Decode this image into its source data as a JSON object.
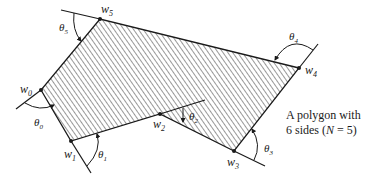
{
  "diagram": {
    "type": "polygon-figure",
    "vertices": [
      {
        "id": "w0",
        "label": "w",
        "sub": "0",
        "x": 41,
        "y": 90
      },
      {
        "id": "w1",
        "label": "w",
        "sub": "1",
        "x": 71,
        "y": 141
      },
      {
        "id": "w2",
        "label": "w",
        "sub": "2",
        "x": 160,
        "y": 114
      },
      {
        "id": "w3",
        "label": "w",
        "sub": "3",
        "x": 234,
        "y": 151
      },
      {
        "id": "w4",
        "label": "w",
        "sub": "4",
        "x": 299,
        "y": 68
      },
      {
        "id": "w5",
        "label": "w",
        "sub": "5",
        "x": 100,
        "y": 19
      }
    ],
    "angles": [
      {
        "id": "theta0",
        "label": "θ",
        "sub": "0"
      },
      {
        "id": "theta1",
        "label": "θ",
        "sub": "1"
      },
      {
        "id": "theta2",
        "label": "θ",
        "sub": "2"
      },
      {
        "id": "theta3",
        "label": "θ",
        "sub": "3"
      },
      {
        "id": "theta4",
        "label": "θ",
        "sub": "4"
      },
      {
        "id": "theta5",
        "label": "θ",
        "sub": "5"
      }
    ],
    "fill": "hatched",
    "stroke_color": "#1a1a1a"
  },
  "caption": {
    "line1": "A polygon with",
    "line2_prefix": "6 sides (",
    "line2_var": "N",
    "line2_suffix": " = 5)"
  }
}
